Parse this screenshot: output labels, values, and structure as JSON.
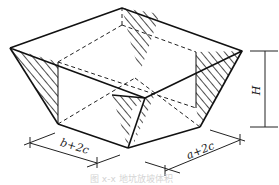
{
  "figure": {
    "type": "isometric-frustum-pit",
    "labels": {
      "width_bottom": "b+2c",
      "length_bottom": "a+2c",
      "height": "H"
    },
    "caption": "图 x-x 地坑放坡体积"
  },
  "colors": {
    "line": "#1a1a1a",
    "hatch": "#222222",
    "caption": "#d0d0d0"
  }
}
